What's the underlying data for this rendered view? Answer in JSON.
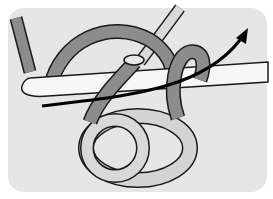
{
  "illustration": {
    "subject": "crochet hook with yarn loop and direction arrow",
    "colors": {
      "background": "#ffffff",
      "panel": "#e6e6e6",
      "yarn_dark": "#8c8c8c",
      "yarn_light": "#d4d4d4",
      "hook": "#f7f7f7",
      "outline": "#1a1a1a",
      "arrow": "#000000"
    }
  }
}
